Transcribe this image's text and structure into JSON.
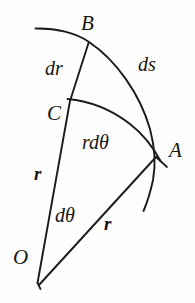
{
  "figure": {
    "kind": "geometry-diagram",
    "background_color": "#fefefe",
    "ink_color": "#1d1b19",
    "width": 195,
    "height": 303
  },
  "labels": {
    "point_b": "B",
    "point_c": "C",
    "point_a": "A",
    "point_o": "O",
    "dr": "dr",
    "ds": "ds",
    "r_d_theta": "rdθ",
    "r_left": "r",
    "d_theta": "dθ",
    "r_right": "r"
  },
  "geometry": {
    "origin": {
      "x": 38,
      "y": 278
    },
    "point_b": {
      "x": 88,
      "y": 42
    },
    "point_c": {
      "x": 70,
      "y": 100
    },
    "point_a": {
      "x": 155,
      "y": 156
    },
    "outer_arc": {
      "start": {
        "x": 35,
        "y": 28
      },
      "through_b": {
        "x": 88,
        "y": 42
      },
      "through_a": {
        "x": 155,
        "y": 156
      },
      "end": {
        "x": 143,
        "y": 211
      }
    },
    "inner_arc": {
      "start": {
        "x": 68,
        "y": 99
      },
      "end": {
        "x": 160,
        "y": 161
      }
    },
    "segment_ob": {
      "from": "origin",
      "to": "point_b"
    },
    "segment_oa": {
      "from": "origin",
      "to": "point_a"
    },
    "tick_a_overshoot": {
      "x": 166,
      "y": 166
    },
    "tick_o_overshoot": {
      "x": 41,
      "y": 288
    }
  }
}
